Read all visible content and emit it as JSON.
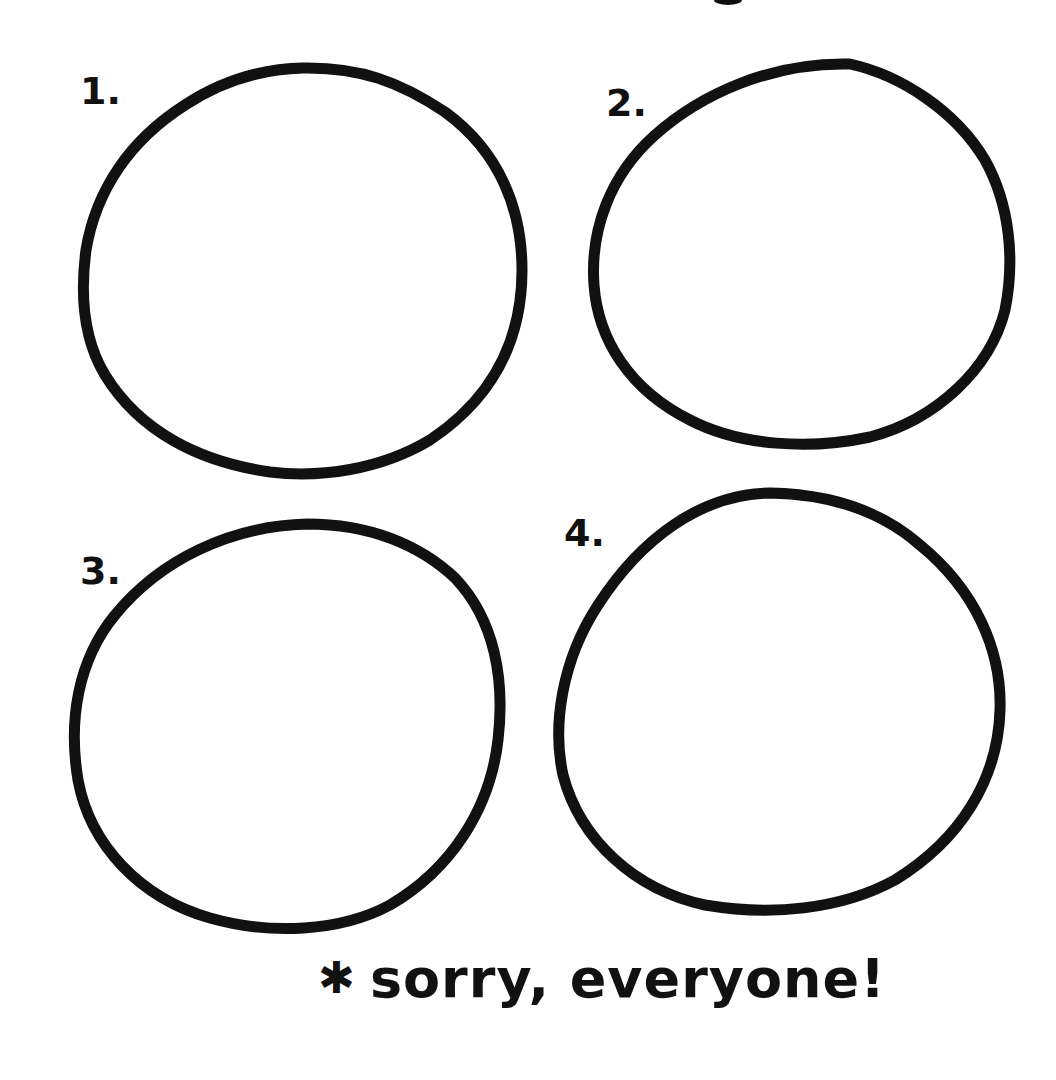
{
  "drawing": {
    "background": "#ffffff",
    "ink_color": "#111111",
    "circles": [
      {
        "label": "1.",
        "cx": 302,
        "cy": 272,
        "rx": 218,
        "ry": 202
      },
      {
        "label": "2.",
        "cx": 804,
        "cy": 252,
        "rx": 208,
        "ry": 192
      },
      {
        "label": "3.",
        "cx": 288,
        "cy": 728,
        "rx": 212,
        "ry": 198
      },
      {
        "label": "4.",
        "cx": 780,
        "cy": 700,
        "rx": 222,
        "ry": 205
      }
    ],
    "footer": {
      "icon": "asterisk-icon",
      "asterisk": "✱",
      "text": "sorry, everyone!"
    }
  }
}
